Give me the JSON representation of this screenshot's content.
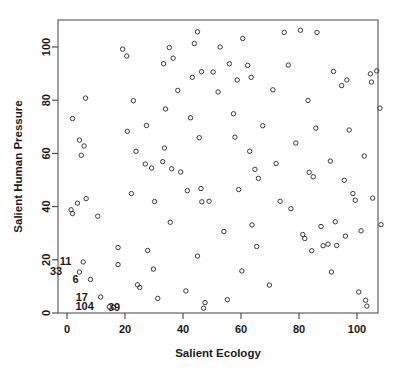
{
  "chart_data": {
    "type": "scatter",
    "title": "",
    "xlabel": "Salient Ecology",
    "ylabel": "Salient Human Pressure",
    "xlim": [
      -3,
      110
    ],
    "ylim": [
      -3,
      110
    ],
    "xticks": [
      0,
      20,
      40,
      60,
      80,
      100
    ],
    "yticks": [
      0,
      20,
      40,
      60,
      80,
      100
    ],
    "grid": false,
    "legend": null,
    "marker": "open-circle",
    "point_labels": [
      {
        "text": "11",
        "x": 3.6,
        "y": 19.2
      },
      {
        "text": "33",
        "x": 0.4,
        "y": 15.5
      },
      {
        "text": "6",
        "x": 6.1,
        "y": 12.5
      },
      {
        "text": "17",
        "x": 9.3,
        "y": 6.0
      },
      {
        "text": "104",
        "x": 11.3,
        "y": 2.3
      },
      {
        "text": "39",
        "x": 20.4,
        "y": 2.0
      }
    ],
    "points": [
      {
        "x": 1.9,
        "y": 73.1
      },
      {
        "x": 1.4,
        "y": 38.8
      },
      {
        "x": 1.9,
        "y": 37.4
      },
      {
        "x": 3.6,
        "y": 41.3
      },
      {
        "x": 4.3,
        "y": 65.0
      },
      {
        "x": 4.9,
        "y": 59.3
      },
      {
        "x": 5.9,
        "y": 62.8
      },
      {
        "x": 6.6,
        "y": 43.0
      },
      {
        "x": 6.4,
        "y": 80.8
      },
      {
        "x": 5.6,
        "y": 19.2
      },
      {
        "x": 4.3,
        "y": 15.4
      },
      {
        "x": 8.1,
        "y": 12.6
      },
      {
        "x": 10.6,
        "y": 36.4
      },
      {
        "x": 11.6,
        "y": 6.0
      },
      {
        "x": 14.6,
        "y": 2.3
      },
      {
        "x": 16.0,
        "y": 2.1
      },
      {
        "x": 19.2,
        "y": 99.2
      },
      {
        "x": 20.6,
        "y": 96.6
      },
      {
        "x": 20.8,
        "y": 68.3
      },
      {
        "x": 22.9,
        "y": 79.8
      },
      {
        "x": 23.8,
        "y": 60.8
      },
      {
        "x": 17.6,
        "y": 24.6
      },
      {
        "x": 17.6,
        "y": 18.2
      },
      {
        "x": 27.4,
        "y": 70.5
      },
      {
        "x": 27.0,
        "y": 56.0
      },
      {
        "x": 29.2,
        "y": 54.5
      },
      {
        "x": 24.3,
        "y": 10.6
      },
      {
        "x": 25.1,
        "y": 9.6
      },
      {
        "x": 27.8,
        "y": 23.5
      },
      {
        "x": 29.8,
        "y": 16.5
      },
      {
        "x": 31.3,
        "y": 5.5
      },
      {
        "x": 33.0,
        "y": 56.9
      },
      {
        "x": 33.6,
        "y": 62.0
      },
      {
        "x": 34.0,
        "y": 76.7
      },
      {
        "x": 35.6,
        "y": 34.1
      },
      {
        "x": 36.1,
        "y": 54.2
      },
      {
        "x": 33.3,
        "y": 93.7
      },
      {
        "x": 35.3,
        "y": 99.8
      },
      {
        "x": 36.6,
        "y": 95.8
      },
      {
        "x": 38.2,
        "y": 83.7
      },
      {
        "x": 39.2,
        "y": 53.0
      },
      {
        "x": 41.0,
        "y": 8.3
      },
      {
        "x": 41.5,
        "y": 46.0
      },
      {
        "x": 42.6,
        "y": 73.4
      },
      {
        "x": 43.2,
        "y": 88.6
      },
      {
        "x": 43.9,
        "y": 101.3
      },
      {
        "x": 45.0,
        "y": 105.7
      },
      {
        "x": 45.6,
        "y": 65.9
      },
      {
        "x": 46.2,
        "y": 46.8
      },
      {
        "x": 46.5,
        "y": 41.8
      },
      {
        "x": 45.0,
        "y": 21.4
      },
      {
        "x": 47.1,
        "y": 1.8
      },
      {
        "x": 47.6,
        "y": 3.9
      },
      {
        "x": 49.0,
        "y": 42.0
      },
      {
        "x": 50.4,
        "y": 90.6
      },
      {
        "x": 52.1,
        "y": 83.1
      },
      {
        "x": 52.8,
        "y": 100.0
      },
      {
        "x": 54.1,
        "y": 30.6
      },
      {
        "x": 56.0,
        "y": 93.7
      },
      {
        "x": 57.4,
        "y": 74.9
      },
      {
        "x": 57.9,
        "y": 66.1
      },
      {
        "x": 58.7,
        "y": 87.6
      },
      {
        "x": 59.2,
        "y": 46.4
      },
      {
        "x": 60.6,
        "y": 103.2
      },
      {
        "x": 60.3,
        "y": 15.8
      },
      {
        "x": 62.3,
        "y": 93.1
      },
      {
        "x": 63.0,
        "y": 60.8
      },
      {
        "x": 63.5,
        "y": 88.6
      },
      {
        "x": 63.8,
        "y": 33.1
      },
      {
        "x": 64.8,
        "y": 54.0
      },
      {
        "x": 65.4,
        "y": 25.0
      },
      {
        "x": 66.0,
        "y": 50.6
      },
      {
        "x": 67.5,
        "y": 70.4
      },
      {
        "x": 69.8,
        "y": 10.5
      },
      {
        "x": 71.0,
        "y": 83.9
      },
      {
        "x": 72.1,
        "y": 56.2
      },
      {
        "x": 73.5,
        "y": 42.0
      },
      {
        "x": 74.9,
        "y": 105.5
      },
      {
        "x": 76.3,
        "y": 93.2
      },
      {
        "x": 77.2,
        "y": 39.2
      },
      {
        "x": 78.9,
        "y": 63.9
      },
      {
        "x": 80.5,
        "y": 106.3
      },
      {
        "x": 81.3,
        "y": 29.5
      },
      {
        "x": 82.0,
        "y": 28.0
      },
      {
        "x": 83.1,
        "y": 79.9
      },
      {
        "x": 83.5,
        "y": 52.9
      },
      {
        "x": 84.4,
        "y": 23.4
      },
      {
        "x": 84.9,
        "y": 51.2
      },
      {
        "x": 86.2,
        "y": 105.5
      },
      {
        "x": 85.8,
        "y": 69.5
      },
      {
        "x": 87.6,
        "y": 32.5
      },
      {
        "x": 88.3,
        "y": 25.3
      },
      {
        "x": 90.0,
        "y": 25.9
      },
      {
        "x": 90.8,
        "y": 57.1
      },
      {
        "x": 91.2,
        "y": 15.4
      },
      {
        "x": 91.9,
        "y": 90.8
      },
      {
        "x": 92.5,
        "y": 34.3
      },
      {
        "x": 93.0,
        "y": 25.4
      },
      {
        "x": 94.7,
        "y": 85.5
      },
      {
        "x": 95.6,
        "y": 49.9
      },
      {
        "x": 96.0,
        "y": 28.9
      },
      {
        "x": 96.5,
        "y": 87.6
      },
      {
        "x": 97.3,
        "y": 68.8
      },
      {
        "x": 98.6,
        "y": 44.9
      },
      {
        "x": 99.4,
        "y": 42.4
      },
      {
        "x": 100.6,
        "y": 7.9
      },
      {
        "x": 101.4,
        "y": 30.9
      },
      {
        "x": 102.5,
        "y": 59.0
      },
      {
        "x": 103.0,
        "y": 4.8
      },
      {
        "x": 103.4,
        "y": 2.6
      },
      {
        "x": 104.6,
        "y": 89.9
      },
      {
        "x": 105.0,
        "y": 86.8
      },
      {
        "x": 105.4,
        "y": 43.2
      },
      {
        "x": 106.8,
        "y": 91.0
      },
      {
        "x": 107.9,
        "y": 77.0
      },
      {
        "x": 108.3,
        "y": 33.2
      },
      {
        "x": 46.4,
        "y": 90.7
      },
      {
        "x": 55.3,
        "y": 5.0
      },
      {
        "x": 22.2,
        "y": 44.9
      },
      {
        "x": 30.2,
        "y": 41.9
      }
    ]
  }
}
